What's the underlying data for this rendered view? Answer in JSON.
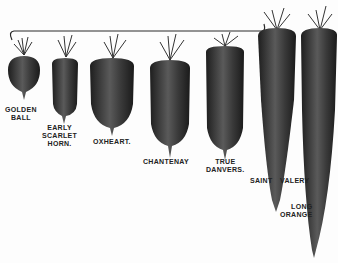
{
  "colors": {
    "ink": "#2a2a2a",
    "body": "#3a3a3a",
    "highlight": "#6a6a6a",
    "leaf": "#333333",
    "background": "#fdfdfd"
  },
  "carrots": [
    {
      "name": "golden-ball",
      "label_line1": "GOLDEN",
      "label_line2": "BALL",
      "label_line3": ""
    },
    {
      "name": "early-scarlet-horn",
      "label_line1": "EARLY",
      "label_line2": "SCARLET",
      "label_line3": "HORN."
    },
    {
      "name": "oxheart",
      "label_line1": "OXHEART.",
      "label_line2": "",
      "label_line3": ""
    },
    {
      "name": "chantenay",
      "label_line1": "CHANTENAY",
      "label_line2": "",
      "label_line3": ""
    },
    {
      "name": "true-danvers",
      "label_line1": "TRUE",
      "label_line2": "DANVERS.",
      "label_line3": ""
    },
    {
      "name": "saint-valery",
      "label_line1": "SAINT",
      "label_line2": "VALERY",
      "label_line3": ""
    },
    {
      "name": "long-orange",
      "label_line1": "LONG",
      "label_line2": "ORANGE",
      "label_line3": ""
    }
  ]
}
